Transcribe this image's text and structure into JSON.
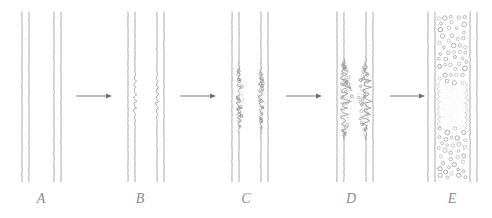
{
  "figure": {
    "caption": "",
    "background_color": "#ffffff",
    "ink_color": "#8d8d8d",
    "line_color": "#9a9a9a",
    "arrow_color": "#6f6f6f",
    "vesicle_color": "#7d7d7d"
  },
  "labels": {
    "a": "A",
    "b": "B",
    "c": "C",
    "d": "D",
    "e": "E"
  },
  "panels": [
    {
      "id": "A",
      "label": "A",
      "label_x": 41,
      "description": "Two separate membranes, each drawn as a pair of smooth straight parallel lines, with an intact gap between them.",
      "state": "apposed-smooth",
      "membrane_pairs": 2,
      "lines_x": [
        22,
        29,
        54,
        61
      ],
      "line_top": 12,
      "line_bottom": 182,
      "has_perturbation": false,
      "has_vesicles": false
    },
    {
      "id": "B",
      "label": "B",
      "label_x": 140,
      "description": "The two inner facing leaflets become wavy and undulating over the central region while outer leaflets remain straight.",
      "state": "undulating",
      "membrane_pairs": 2,
      "lines_x": [
        128,
        135,
        157,
        164
      ],
      "line_top": 12,
      "line_bottom": 182,
      "has_perturbation": true,
      "perturbation_lines": [
        135,
        157
      ],
      "perturbation_top": 68,
      "perturbation_bottom": 128,
      "perturbation_amplitude": 2.2,
      "has_vesicles": false
    },
    {
      "id": "C",
      "label": "C",
      "label_x": 246,
      "description": "The undulating inner leaflets break into beaded clusters of small vesicles along the central region.",
      "state": "beaded-vesiculation",
      "membrane_pairs": 2,
      "lines_x": [
        232,
        239,
        261,
        268
      ],
      "line_top": 12,
      "line_bottom": 182,
      "has_perturbation": true,
      "perturbation_lines": [
        239,
        261
      ],
      "perturbation_top": 62,
      "perturbation_bottom": 134,
      "perturbation_amplitude": 3.6,
      "has_vesicles": true,
      "vesicle_zone": "inner-leaflets"
    },
    {
      "id": "D",
      "label": "D",
      "label_x": 351,
      "description": "The beaded regions swell into two stippled clouds of particles that bulge inward and nearly bridge the intermembrane gap.",
      "state": "bulging-clouds",
      "membrane_pairs": 2,
      "lines_x": [
        337,
        344,
        366,
        373
      ],
      "line_top": 12,
      "line_bottom": 182,
      "has_perturbation": true,
      "perturbation_lines": [
        344,
        366
      ],
      "perturbation_top": 58,
      "perturbation_bottom": 140,
      "perturbation_amplitude": 7,
      "has_vesicles": true,
      "vesicle_zone": "bulging-cloud"
    },
    {
      "id": "E",
      "label": "E",
      "label_x": 452,
      "description": "The membranes have fused into a single continuous compartment densely filled with small open vesicles, with a pale cloudy band crossing the middle where fusion occurred.",
      "state": "fused",
      "membrane_pairs": 2,
      "lines_x": [
        428,
        435,
        470,
        477
      ],
      "line_top": 12,
      "line_bottom": 182,
      "has_perturbation": false,
      "has_vesicles": true,
      "vesicle_zone": "whole-lumen",
      "fusion_band_top": 88,
      "fusion_band_bottom": 124
    }
  ],
  "arrows": [
    {
      "id": "arrow-a-b",
      "from": "A",
      "to": "B",
      "x1": 76,
      "x2": 112,
      "y": 96
    },
    {
      "id": "arrow-b-c",
      "from": "B",
      "to": "C",
      "x1": 180,
      "x2": 216,
      "y": 96
    },
    {
      "id": "arrow-c-d",
      "from": "C",
      "to": "D",
      "x1": 286,
      "x2": 322,
      "y": 96
    },
    {
      "id": "arrow-d-e",
      "from": "D",
      "to": "E",
      "x1": 390,
      "x2": 425,
      "y": 96
    }
  ]
}
